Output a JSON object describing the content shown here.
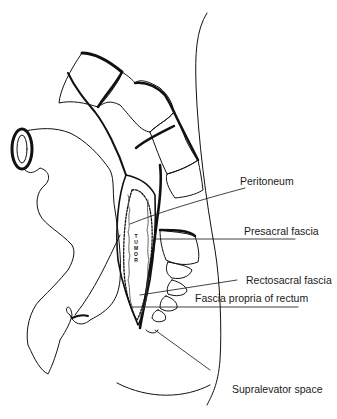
{
  "figure": {
    "type": "anatomical line drawing"
  },
  "labels": {
    "peritoneum": "Peritoneum",
    "presacral_fascia": "Presacral fascia",
    "rectosacral_fascia": "Rectosacral fascia",
    "fascia_propria": "Fascia propria of rectum",
    "supralevator_space": "Supralevator space"
  },
  "tumor_text": "TUMOR",
  "colors": {
    "line": "#111111",
    "background": "#ffffff",
    "stipple": "#555555"
  }
}
